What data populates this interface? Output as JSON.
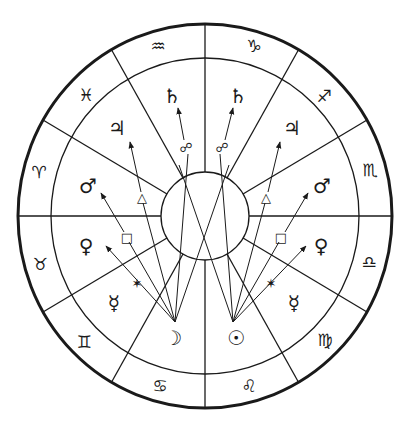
{
  "diagram": {
    "type": "astrological-chart-wheel",
    "colors": {
      "ink": "#1a1a1a",
      "background": "#ffffff"
    },
    "zodiac_ring": {
      "signs": [
        {
          "name": "aquarius",
          "glyph": "♒"
        },
        {
          "name": "capricorn",
          "glyph": "♑"
        },
        {
          "name": "sagittarius",
          "glyph": "♐"
        },
        {
          "name": "scorpio",
          "glyph": "♏"
        },
        {
          "name": "libra",
          "glyph": "♎"
        },
        {
          "name": "virgo",
          "glyph": "♍"
        },
        {
          "name": "leo",
          "glyph": "♌"
        },
        {
          "name": "cancer",
          "glyph": "♋"
        },
        {
          "name": "gemini",
          "glyph": "♊"
        },
        {
          "name": "taurus",
          "glyph": "♉"
        },
        {
          "name": "aries",
          "glyph": "♈"
        },
        {
          "name": "pisces",
          "glyph": "♓"
        }
      ]
    },
    "houses": {
      "left": [
        {
          "name": "saturn",
          "glyph": "♄"
        },
        {
          "name": "jupiter",
          "glyph": "♃"
        },
        {
          "name": "mars",
          "glyph": "♂"
        },
        {
          "name": "venus",
          "glyph": "♀"
        },
        {
          "name": "mercury",
          "glyph": "☿"
        },
        {
          "name": "moon",
          "glyph": "☽"
        }
      ],
      "right": [
        {
          "name": "saturn",
          "glyph": "♄"
        },
        {
          "name": "jupiter",
          "glyph": "♃"
        },
        {
          "name": "mars",
          "glyph": "♂"
        },
        {
          "name": "venus",
          "glyph": "♀"
        },
        {
          "name": "mercury",
          "glyph": "☿"
        },
        {
          "name": "sun",
          "glyph": "☉"
        }
      ]
    },
    "aspects": [
      {
        "name": "opposition",
        "glyph": "☍"
      },
      {
        "name": "trine",
        "glyph": "△"
      },
      {
        "name": "square",
        "glyph": "□"
      },
      {
        "name": "sextile",
        "glyph": "✶"
      }
    ],
    "left_aspects": {
      "opposition": "☍",
      "trine": "△",
      "square": "□",
      "sextile": "✶"
    },
    "right_aspects": {
      "opposition": "☍",
      "trine": "△",
      "square": "□",
      "sextile": "✶"
    }
  }
}
